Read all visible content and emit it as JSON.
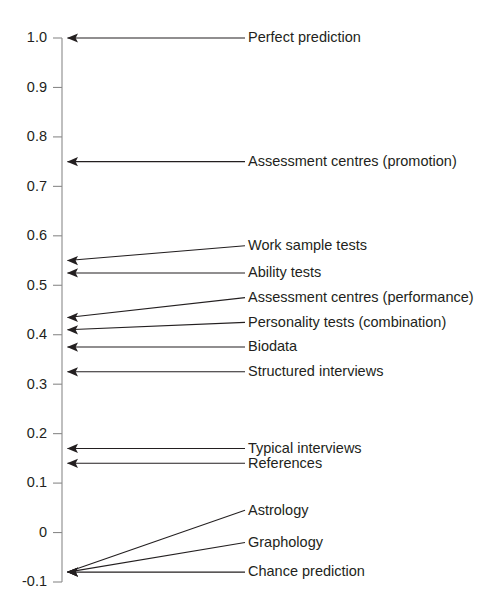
{
  "chart_data": {
    "type": "scatter",
    "title": "",
    "subtitle": "",
    "xlabel": "",
    "ylabel": "",
    "grid": false,
    "legend_position": "none",
    "orientation": "horizontal-leader-lines",
    "ylim": [
      -0.1,
      1.0
    ],
    "ytick_labels": [
      "1.0",
      "0.9",
      "0.8",
      "0.7",
      "0.6",
      "0.5",
      "0.4",
      "0.3",
      "0.2",
      "0.1",
      "0",
      "-0.1"
    ],
    "ytick_values": [
      1.0,
      0.9,
      0.8,
      0.7,
      0.6,
      0.5,
      0.4,
      0.3,
      0.2,
      0.1,
      0.0,
      -0.1
    ],
    "categories": [
      "Perfect prediction",
      "Assessment centres (promotion)",
      "Work sample tests",
      "Ability tests",
      "Assessment centres (performance)",
      "Personality tests (combination)",
      "Biodata",
      "Structured interviews",
      "Typical interviews",
      "References",
      "Astrology",
      "Graphology",
      "Chance prediction"
    ],
    "values": [
      1.0,
      0.75,
      0.55,
      0.525,
      0.435,
      0.41,
      0.375,
      0.325,
      0.17,
      0.14,
      -0.08,
      -0.08,
      -0.08
    ],
    "points": [
      {
        "label": "Perfect prediction",
        "value": 1.0,
        "label_y": 1.0
      },
      {
        "label": "Assessment centres (promotion)",
        "value": 0.75,
        "label_y": 0.75
      },
      {
        "label": "Work sample tests",
        "value": 0.55,
        "label_y": 0.58
      },
      {
        "label": "Ability tests",
        "value": 0.525,
        "label_y": 0.525
      },
      {
        "label": "Assessment centres (performance)",
        "value": 0.435,
        "label_y": 0.475
      },
      {
        "label": "Personality tests (combination)",
        "value": 0.41,
        "label_y": 0.425
      },
      {
        "label": "Biodata",
        "value": 0.375,
        "label_y": 0.375
      },
      {
        "label": "Structured interviews",
        "value": 0.325,
        "label_y": 0.325
      },
      {
        "label": "Typical interviews",
        "value": 0.17,
        "label_y": 0.17
      },
      {
        "label": "References",
        "value": 0.14,
        "label_y": 0.14
      },
      {
        "label": "Astrology",
        "value": -0.08,
        "label_y": 0.045
      },
      {
        "label": "Graphology",
        "value": -0.08,
        "label_y": -0.02
      },
      {
        "label": "Chance prediction",
        "value": -0.08,
        "label_y": -0.08
      }
    ]
  },
  "colors": {
    "background": "#ffffff",
    "text": "#231f20",
    "axis": "#8a8a8a",
    "line": "#231f20"
  },
  "geometry": {
    "axis_x": 62,
    "label_x": 248,
    "line_end_x": 245,
    "y_top": 38,
    "y_bottom": 582,
    "tick_len": 9
  }
}
